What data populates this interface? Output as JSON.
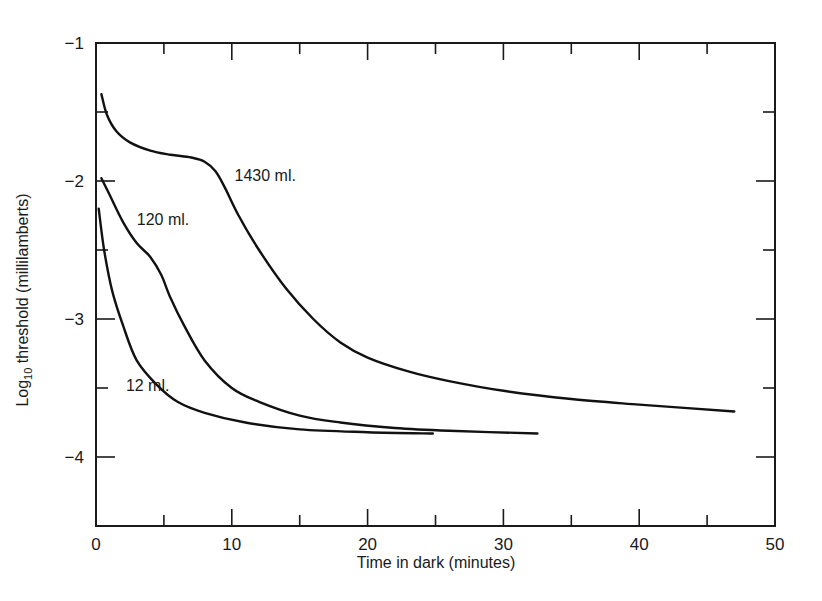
{
  "chart_data": {
    "type": "line",
    "title": "",
    "xlabel": "Time in dark (minutes)",
    "ylabel": "Log10 threshold (millilamberts)",
    "ylabel_parts": {
      "prefix": "Log",
      "subscript": "10",
      "suffix": " threshold (millilamberts)"
    },
    "xlim": [
      0,
      50
    ],
    "ylim": [
      -4.5,
      -1
    ],
    "x_ticks": [
      0,
      10,
      20,
      30,
      40,
      50
    ],
    "x_tick_labels": [
      "0",
      "10",
      "20",
      "30",
      "40",
      "50"
    ],
    "x_minor_ticks": [
      5,
      15,
      25,
      35,
      45
    ],
    "y_ticks": [
      -1,
      -2,
      -3,
      -4
    ],
    "y_tick_labels": [
      "−1",
      "−2",
      "−3",
      "−4"
    ],
    "y_minor_ticks": [
      -1.5,
      -2.5,
      -3.5
    ],
    "grid": false,
    "legend": "inline labels on curves",
    "series": [
      {
        "name": "1430 ml.",
        "label_pos": {
          "x": 10.2,
          "y": -2.0
        },
        "points": [
          [
            0.4,
            -1.37
          ],
          [
            0.8,
            -1.52
          ],
          [
            1.5,
            -1.64
          ],
          [
            2.5,
            -1.72
          ],
          [
            4,
            -1.78
          ],
          [
            5.5,
            -1.81
          ],
          [
            7,
            -1.83
          ],
          [
            8,
            -1.86
          ],
          [
            8.8,
            -1.93
          ],
          [
            9.5,
            -2.05
          ],
          [
            10.5,
            -2.25
          ],
          [
            12,
            -2.5
          ],
          [
            14,
            -2.78
          ],
          [
            16,
            -3.0
          ],
          [
            18,
            -3.17
          ],
          [
            20,
            -3.28
          ],
          [
            23,
            -3.38
          ],
          [
            26,
            -3.45
          ],
          [
            30,
            -3.52
          ],
          [
            35,
            -3.58
          ],
          [
            40,
            -3.62
          ],
          [
            47,
            -3.67
          ]
        ]
      },
      {
        "name": "120 ml.",
        "label_pos": {
          "x": 3.0,
          "y": -2.32
        },
        "points": [
          [
            0.4,
            -1.98
          ],
          [
            1,
            -2.1
          ],
          [
            2,
            -2.3
          ],
          [
            3,
            -2.45
          ],
          [
            4,
            -2.55
          ],
          [
            4.8,
            -2.68
          ],
          [
            5.5,
            -2.85
          ],
          [
            6.5,
            -3.05
          ],
          [
            8,
            -3.3
          ],
          [
            10,
            -3.5
          ],
          [
            12,
            -3.6
          ],
          [
            15,
            -3.7
          ],
          [
            18,
            -3.75
          ],
          [
            22,
            -3.79
          ],
          [
            26,
            -3.81
          ],
          [
            32.5,
            -3.83
          ]
        ]
      },
      {
        "name": "12 ml.",
        "label_pos": {
          "x": 2.2,
          "y": -3.52
        },
        "points": [
          [
            0.2,
            -2.2
          ],
          [
            0.6,
            -2.5
          ],
          [
            1.2,
            -2.8
          ],
          [
            2,
            -3.05
          ],
          [
            3,
            -3.3
          ],
          [
            4.5,
            -3.48
          ],
          [
            6,
            -3.6
          ],
          [
            8,
            -3.68
          ],
          [
            11,
            -3.75
          ],
          [
            15,
            -3.8
          ],
          [
            20,
            -3.82
          ],
          [
            24.8,
            -3.83
          ]
        ]
      }
    ]
  }
}
